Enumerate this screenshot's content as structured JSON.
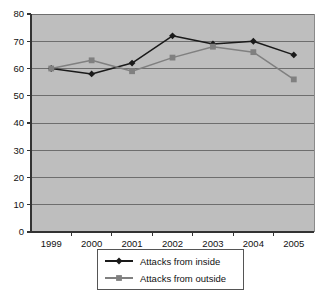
{
  "chart_data": {
    "type": "line",
    "title": "",
    "xlabel": "",
    "ylabel": "",
    "categories": [
      "1999",
      "2000",
      "2001",
      "2002",
      "2003",
      "2004",
      "2005"
    ],
    "series": [
      {
        "name": "Attacks from inside",
        "marker": "diamond",
        "color": "#1a1a1a",
        "values": [
          60,
          58,
          62,
          72,
          69,
          70,
          65
        ]
      },
      {
        "name": "Attacks from outside",
        "marker": "square",
        "color": "#808080",
        "values": [
          60,
          63,
          59,
          64,
          68,
          66,
          56
        ]
      }
    ],
    "ylim": [
      0,
      80
    ],
    "ytick_values": [
      0,
      10,
      20,
      30,
      40,
      50,
      60,
      70,
      80
    ],
    "ytick_labels": [
      "0",
      "10",
      "20",
      "30",
      "40",
      "50",
      "60",
      "70",
      "80"
    ],
    "grid": true,
    "grid_axis": "y",
    "legend_position": "bottom",
    "plot_background_color": "#bebebe",
    "grid_color": "#6e6e6e",
    "axis_color": "#333333",
    "page_background_color": "#ffffff"
  }
}
